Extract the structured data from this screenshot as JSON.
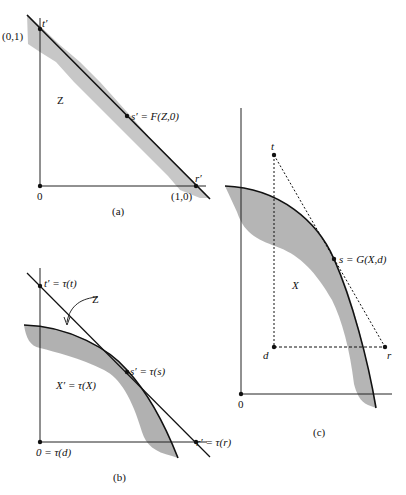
{
  "panels": {
    "a": {
      "caption": "(a)",
      "t_label": "t′",
      "s_label": "s′ = F(Z,0)",
      "r_label": "r′",
      "origin_label": "0",
      "y_point_label": "(0,1)",
      "x_point_label": "(1,0)",
      "region_label": "Z"
    },
    "b": {
      "caption": "(b)",
      "t_label": "t′ = τ(t)",
      "s_label": "s′ = τ(s)",
      "r_label": "r′ = τ(r)",
      "origin_label": "0 = τ(d)",
      "region_label": "X′ = τ(X)",
      "arrow_label": "Z"
    },
    "c": {
      "caption": "(c)",
      "t_label": "t",
      "s_label": "s = G(X,d)",
      "r_label": "r",
      "d_label": "d",
      "origin_label": "0",
      "region_label": "X"
    }
  },
  "colors": {
    "stroke": "#111111",
    "shade": "#b9b9b9"
  }
}
